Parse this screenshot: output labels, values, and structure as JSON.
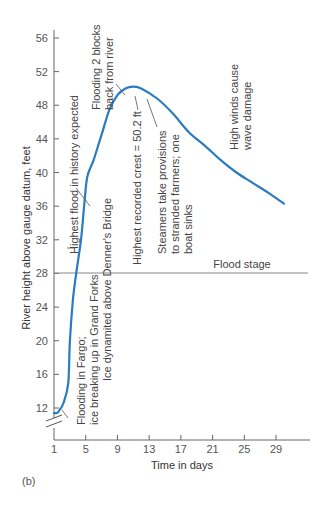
{
  "figure": {
    "panel_label": "(b)",
    "xlabel": "Time in days",
    "ylabel": "River height above gauge datum, feet",
    "flood_stage_label": "Flood stage",
    "colors": {
      "curve": "#2b7bbf",
      "axis": "#666666",
      "flood_stage": "#888888"
    }
  },
  "annotations": [
    {
      "id": "fargo",
      "lines": [
        "Flooding in Fargo;",
        "ice breaking up in Grand Forks"
      ]
    },
    {
      "id": "denner",
      "lines": [
        "Ice dynamited above Denner's Bridge"
      ]
    },
    {
      "id": "highest_expected",
      "lines": [
        "Highest flood in history expected"
      ]
    },
    {
      "id": "flooding_blocks",
      "lines": [
        "Flooding 2 blocks",
        "back from river"
      ]
    },
    {
      "id": "crest",
      "lines": [
        "Highest recorded crest = 50.2 ft"
      ]
    },
    {
      "id": "steamers",
      "lines": [
        "Steamers take provisions",
        "to stranded farmers; one",
        "boat sinks"
      ]
    },
    {
      "id": "winds",
      "lines": [
        "High winds cause",
        "wave damage"
      ]
    }
  ],
  "chart_data": {
    "type": "line",
    "title": "",
    "xlabel": "Time in days",
    "ylabel": "River height above gauge datum, feet",
    "x_ticks": [
      1,
      5,
      9,
      13,
      17,
      21,
      25,
      29
    ],
    "y_ticks": [
      12,
      16,
      20,
      24,
      28,
      32,
      36,
      40,
      44,
      48,
      52,
      56
    ],
    "xlim": [
      1,
      32
    ],
    "ylim": [
      10,
      57
    ],
    "y_axis_break": true,
    "grid": false,
    "reference_lines": [
      {
        "label": "Flood stage",
        "y": 28
      }
    ],
    "series": [
      {
        "name": "River height",
        "x": [
          1,
          1.5,
          2.2,
          2.8,
          3.0,
          3.4,
          3.8,
          4.4,
          4.8,
          5.2,
          6,
          7,
          8,
          9,
          10,
          11,
          12,
          14,
          16,
          18,
          20,
          22,
          24,
          26,
          28,
          30
        ],
        "y": [
          11.4,
          11.5,
          12.6,
          15,
          20,
          25,
          28,
          32,
          36,
          39.5,
          41.5,
          44.5,
          47.5,
          49.2,
          50,
          50.2,
          50,
          48.8,
          47,
          44.8,
          43.2,
          41.5,
          40,
          38.8,
          37.6,
          36.3
        ]
      }
    ],
    "peak": {
      "x": 11,
      "y": 50.2,
      "label": "Highest recorded crest = 50.2 ft"
    },
    "annotations": [
      "Flooding in Fargo; ice breaking up in Grand Forks",
      "Ice dynamited above Denner's Bridge",
      "Highest flood in history expected",
      "Flooding 2 blocks back from river",
      "Highest recorded crest = 50.2 ft",
      "Steamers take provisions to stranded farmers; one boat sinks",
      "High winds cause wave damage"
    ]
  }
}
